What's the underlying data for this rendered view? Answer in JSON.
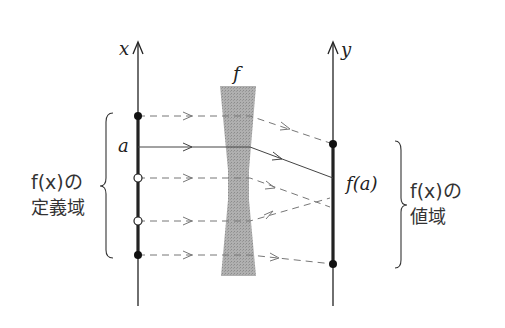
{
  "diagram": {
    "type": "function-mapping",
    "axes": {
      "x_label": "x",
      "y_label": "y"
    },
    "function_label": "f",
    "point_label_a": "a",
    "image_label": "f(a)",
    "domain_label": {
      "line1": "f(x)の",
      "line2": "定義域"
    },
    "range_label": {
      "line1": "f(x)の",
      "line2": "値域"
    },
    "mappings": [
      {
        "from_y": 116,
        "to_y": 144,
        "style": "dashed",
        "from_point": "filled",
        "to_point": "filled"
      },
      {
        "from_y": 147,
        "to_y": 178,
        "style": "solid",
        "from_point": "a",
        "to_point": "f(a)"
      },
      {
        "from_y": 178,
        "to_y": 205,
        "style": "dashed",
        "from_point": "open",
        "to_point": "none"
      },
      {
        "from_y": 221,
        "to_y": 200,
        "style": "dashed",
        "from_point": "open",
        "to_point": "none"
      },
      {
        "from_y": 255,
        "to_y": 264,
        "style": "dashed",
        "from_point": "filled",
        "to_point": "filled"
      }
    ],
    "colors": {
      "axis": "#222222",
      "dashed_line": "#777777",
      "solid_line": "#444444",
      "funnel": "#a8a8a8"
    }
  }
}
